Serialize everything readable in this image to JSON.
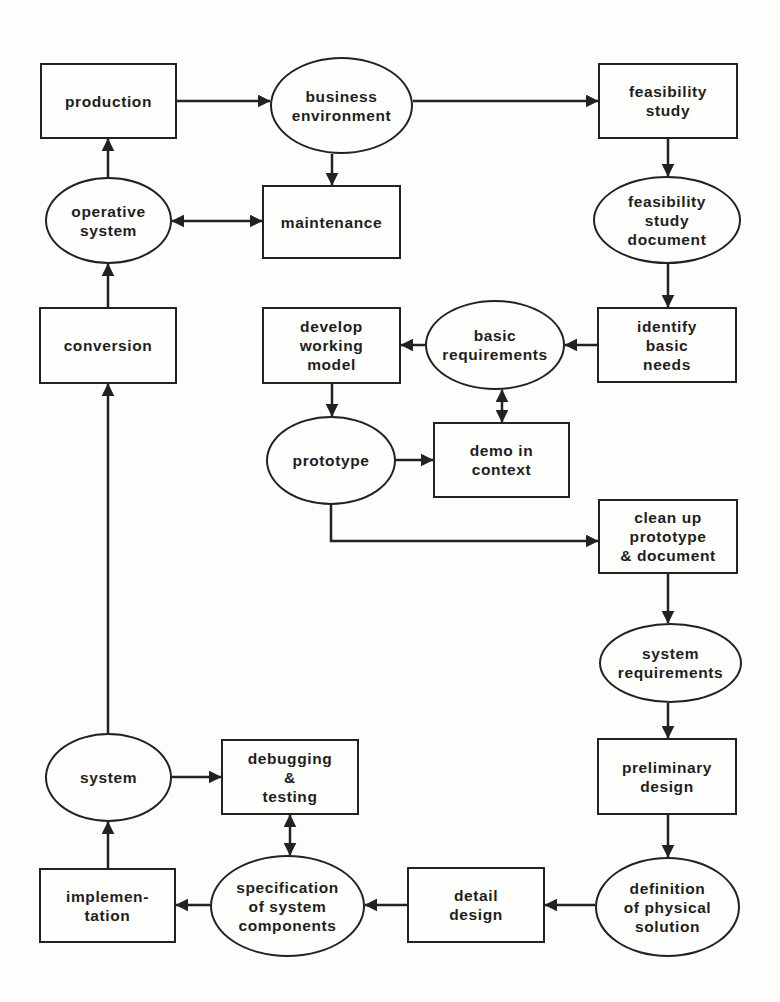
{
  "diagram": {
    "type": "flowchart",
    "colors": {
      "stroke": "#222222",
      "text": "#1e1e1e",
      "background": "#fdfdfb"
    },
    "nodes": [
      {
        "id": "production",
        "shape": "box",
        "label": "production",
        "x": 40,
        "y": 63,
        "w": 137,
        "h": 76
      },
      {
        "id": "business_environment",
        "shape": "ellipse",
        "label": "business\nenvironment",
        "x": 270,
        "y": 57,
        "w": 143,
        "h": 97
      },
      {
        "id": "feasibility_study",
        "shape": "box",
        "label": "feasibility\nstudy",
        "x": 598,
        "y": 63,
        "w": 140,
        "h": 76
      },
      {
        "id": "operative_system",
        "shape": "ellipse",
        "label": "operative\nsystem",
        "x": 45,
        "y": 177,
        "w": 127,
        "h": 87
      },
      {
        "id": "maintenance",
        "shape": "box",
        "label": "maintenance",
        "x": 262,
        "y": 185,
        "w": 139,
        "h": 74
      },
      {
        "id": "feasibility_study_document",
        "shape": "ellipse",
        "label": "feasibility\nstudy\ndocument",
        "x": 593,
        "y": 176,
        "w": 148,
        "h": 88
      },
      {
        "id": "conversion",
        "shape": "box",
        "label": "conversion",
        "x": 39,
        "y": 307,
        "w": 138,
        "h": 77
      },
      {
        "id": "develop_working_model",
        "shape": "box",
        "label": "develop\nworking\nmodel",
        "x": 262,
        "y": 307,
        "w": 139,
        "h": 77
      },
      {
        "id": "basic_requirements",
        "shape": "ellipse",
        "label": "basic\nrequirements",
        "x": 425,
        "y": 300,
        "w": 140,
        "h": 90
      },
      {
        "id": "identify_basic_needs",
        "shape": "box",
        "label": "identify\nbasic\nneeds",
        "x": 597,
        "y": 307,
        "w": 140,
        "h": 76
      },
      {
        "id": "prototype",
        "shape": "ellipse",
        "label": "prototype",
        "x": 266,
        "y": 416,
        "w": 130,
        "h": 89
      },
      {
        "id": "demo_in_context",
        "shape": "box",
        "label": "demo in\ncontext",
        "x": 433,
        "y": 422,
        "w": 137,
        "h": 76
      },
      {
        "id": "clean_up_prototype",
        "shape": "box",
        "label": "clean up\nprototype\n& document",
        "x": 598,
        "y": 499,
        "w": 140,
        "h": 75
      },
      {
        "id": "system_requirements",
        "shape": "ellipse",
        "label": "system\nrequirements",
        "x": 599,
        "y": 623,
        "w": 143,
        "h": 80
      },
      {
        "id": "system",
        "shape": "ellipse",
        "label": "system",
        "x": 45,
        "y": 733,
        "w": 127,
        "h": 89
      },
      {
        "id": "debugging_testing",
        "shape": "box",
        "label": "debugging\n&\ntesting",
        "x": 221,
        "y": 739,
        "w": 138,
        "h": 76
      },
      {
        "id": "preliminary_design",
        "shape": "box",
        "label": "preliminary\ndesign",
        "x": 597,
        "y": 738,
        "w": 140,
        "h": 77
      },
      {
        "id": "implementation",
        "shape": "box",
        "label": "implemen-\ntation",
        "x": 39,
        "y": 868,
        "w": 137,
        "h": 75
      },
      {
        "id": "specification_of_system_components",
        "shape": "ellipse",
        "label": "specification\nof system\ncomponents",
        "x": 210,
        "y": 855,
        "w": 155,
        "h": 102
      },
      {
        "id": "detail_design",
        "shape": "box",
        "label": "detail\ndesign",
        "x": 407,
        "y": 867,
        "w": 138,
        "h": 76
      },
      {
        "id": "definition_of_physical_solution",
        "shape": "ellipse",
        "label": "definition\nof physical\nsolution",
        "x": 595,
        "y": 857,
        "w": 145,
        "h": 100
      }
    ],
    "edges": [
      {
        "from": "production",
        "to": "business_environment",
        "points": [
          [
            177,
            101
          ],
          [
            270,
            101
          ]
        ],
        "arrow": "end"
      },
      {
        "from": "business_environment",
        "to": "feasibility_study",
        "points": [
          [
            413,
            101
          ],
          [
            598,
            101
          ]
        ],
        "arrow": "end"
      },
      {
        "from": "business_environment",
        "to": "maintenance",
        "points": [
          [
            332,
            154
          ],
          [
            332,
            185
          ]
        ],
        "arrow": "end"
      },
      {
        "from": "feasibility_study",
        "to": "feasibility_study_document",
        "points": [
          [
            668,
            139
          ],
          [
            668,
            176
          ]
        ],
        "arrow": "end"
      },
      {
        "from": "operative_system",
        "to": "production",
        "points": [
          [
            108,
            177
          ],
          [
            108,
            139
          ]
        ],
        "arrow": "end"
      },
      {
        "from": "operative_system",
        "to": "maintenance",
        "points": [
          [
            172,
            221
          ],
          [
            262,
            221
          ]
        ],
        "arrow": "both"
      },
      {
        "from": "conversion",
        "to": "operative_system",
        "points": [
          [
            108,
            307
          ],
          [
            108,
            264
          ]
        ],
        "arrow": "end"
      },
      {
        "from": "feasibility_study_document",
        "to": "identify_basic_needs",
        "points": [
          [
            668,
            264
          ],
          [
            668,
            307
          ]
        ],
        "arrow": "end"
      },
      {
        "from": "identify_basic_needs",
        "to": "basic_requirements",
        "points": [
          [
            597,
            345
          ],
          [
            565,
            345
          ]
        ],
        "arrow": "end"
      },
      {
        "from": "basic_requirements",
        "to": "develop_working_model",
        "points": [
          [
            425,
            345
          ],
          [
            401,
            345
          ]
        ],
        "arrow": "end"
      },
      {
        "from": "basic_requirements",
        "to": "demo_in_context",
        "points": [
          [
            502,
            390
          ],
          [
            502,
            422
          ]
        ],
        "arrow": "both"
      },
      {
        "from": "develop_working_model",
        "to": "prototype",
        "points": [
          [
            332,
            384
          ],
          [
            332,
            416
          ]
        ],
        "arrow": "end"
      },
      {
        "from": "prototype",
        "to": "demo_in_context",
        "points": [
          [
            396,
            460
          ],
          [
            433,
            460
          ]
        ],
        "arrow": "end"
      },
      {
        "from": "prototype",
        "to": "clean_up_prototype",
        "points": [
          [
            331,
            505
          ],
          [
            331,
            541
          ],
          [
            598,
            541
          ]
        ],
        "arrow": "end"
      },
      {
        "from": "clean_up_prototype",
        "to": "system_requirements",
        "points": [
          [
            668,
            574
          ],
          [
            668,
            623
          ]
        ],
        "arrow": "end"
      },
      {
        "from": "system_requirements",
        "to": "preliminary_design",
        "points": [
          [
            668,
            703
          ],
          [
            668,
            738
          ]
        ],
        "arrow": "end"
      },
      {
        "from": "preliminary_design",
        "to": "definition_of_physical_solution",
        "points": [
          [
            668,
            815
          ],
          [
            668,
            857
          ]
        ],
        "arrow": "end"
      },
      {
        "from": "definition_of_physical_solution",
        "to": "detail_design",
        "points": [
          [
            595,
            905
          ],
          [
            545,
            905
          ]
        ],
        "arrow": "end"
      },
      {
        "from": "detail_design",
        "to": "specification_of_system_components",
        "points": [
          [
            407,
            905
          ],
          [
            365,
            905
          ]
        ],
        "arrow": "end"
      },
      {
        "from": "specification_of_system_components",
        "to": "implementation",
        "points": [
          [
            210,
            905
          ],
          [
            176,
            905
          ]
        ],
        "arrow": "end"
      },
      {
        "from": "specification_of_system_components",
        "to": "debugging_testing",
        "points": [
          [
            290,
            855
          ],
          [
            290,
            815
          ]
        ],
        "arrow": "both"
      },
      {
        "from": "implementation",
        "to": "system",
        "points": [
          [
            108,
            868
          ],
          [
            108,
            822
          ]
        ],
        "arrow": "end"
      },
      {
        "from": "system",
        "to": "debugging_testing",
        "points": [
          [
            172,
            777
          ],
          [
            221,
            777
          ]
        ],
        "arrow": "end"
      },
      {
        "from": "system",
        "to": "conversion",
        "points": [
          [
            108,
            733
          ],
          [
            108,
            384
          ]
        ],
        "arrow": "end"
      }
    ]
  }
}
